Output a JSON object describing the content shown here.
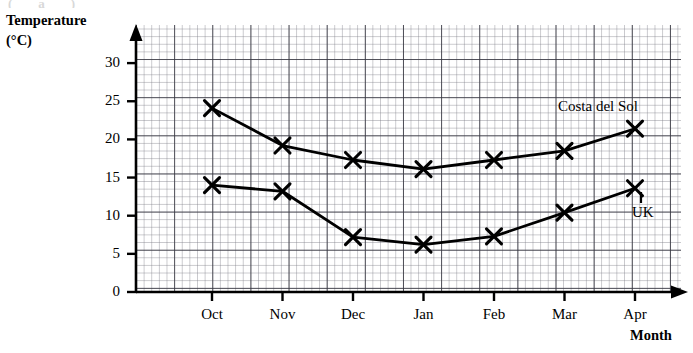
{
  "page": {
    "top_artefact_text": "(a) (b)"
  },
  "axes": {
    "y_title_line1": "Temperature",
    "y_title_line2": "(°C)",
    "x_title": "Month",
    "y_tick_labels": [
      "0",
      "5",
      "10",
      "15",
      "20",
      "25",
      "30"
    ],
    "x_tick_labels": [
      "Oct",
      "Nov",
      "Dec",
      "Jan",
      "Feb",
      "Mar",
      "Apr"
    ]
  },
  "series_labels": {
    "costa": "Costa del Sol",
    "uk": "UK"
  },
  "colors": {
    "ink": "#000000",
    "grid_minor": "#787882",
    "grid_major": "#373741"
  },
  "chart_data": {
    "type": "line",
    "title": "",
    "xlabel": "Month",
    "ylabel": "Temperature (°C)",
    "categories": [
      "Oct",
      "Nov",
      "Dec",
      "Jan",
      "Feb",
      "Mar",
      "Apr"
    ],
    "ylim": [
      0,
      30
    ],
    "yticks": [
      0,
      5,
      10,
      15,
      20,
      25,
      30
    ],
    "grid": true,
    "grid_minor_step": 1,
    "grid_major_step": 5,
    "legend": "inline-labels",
    "marker": "cross",
    "series": [
      {
        "name": "Costa del Sol",
        "values": [
          24.1,
          19.2,
          17.3,
          16.1,
          17.3,
          18.5,
          21.4
        ]
      },
      {
        "name": "UK",
        "values": [
          14.0,
          13.2,
          7.2,
          6.2,
          7.3,
          10.4,
          13.6
        ]
      }
    ],
    "annotations": [
      {
        "text": "Costa del Sol",
        "near": "Apr",
        "series": "Costa del Sol"
      },
      {
        "text": "UK",
        "near": "Apr",
        "series": "UK"
      }
    ]
  }
}
